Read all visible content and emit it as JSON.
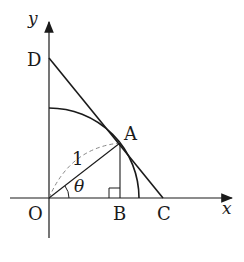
{
  "diagram": {
    "axes": {
      "x_label": "x",
      "y_label": "y"
    },
    "points": {
      "O": "O",
      "A": "A",
      "B": "B",
      "C": "C",
      "D": "D"
    },
    "radius_label": "1",
    "angle_label": "θ",
    "colors": {
      "stroke": "#1a1a1a",
      "dashed": "#888888"
    }
  }
}
